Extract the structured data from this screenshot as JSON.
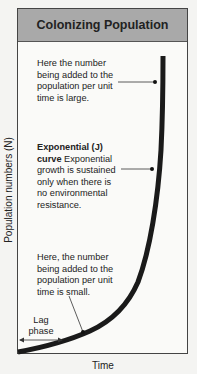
{
  "title": "Colonizing Population",
  "axes": {
    "y_label": "Population numbers (N)",
    "x_label": "Time"
  },
  "annotations": {
    "top": "Here the number being added to the population per unit time is large.",
    "middle_bold": "Exponential (J) curve",
    "middle_text": "Exponential growth is sustained only when there is no environmental resistance.",
    "bottom": "Here, the number being added to the population per unit time is small.",
    "lag_line1": "Lag",
    "lag_line2": "phase"
  },
  "colors": {
    "header_bg": "#a9a9a9",
    "curve": "#1a1a1a"
  }
}
